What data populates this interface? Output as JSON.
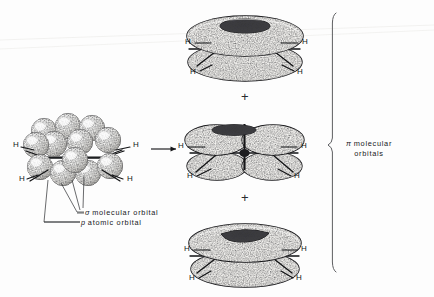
{
  "figure": {
    "background_color": "#fdfdfd",
    "ink_color": "#15161a"
  },
  "atom_label": "H",
  "operators": {
    "arrow": "→",
    "plus": "+"
  },
  "left_structure": {
    "name": "p-orbital-sphere-cluster",
    "sphere_count": 12,
    "hydrogens": [
      {
        "text": "H",
        "x": 13,
        "y": 145
      },
      {
        "text": "H",
        "x": 133,
        "y": 145
      },
      {
        "text": "H",
        "x": 19,
        "y": 177
      },
      {
        "text": "H",
        "x": 128,
        "y": 177
      }
    ],
    "callouts": [
      {
        "symbol": "σ",
        "text": "molecular orbital"
      },
      {
        "symbol": "p",
        "text": "atomic orbital"
      }
    ]
  },
  "right_structures": [
    {
      "name": "pi-orbital-torus-pair-top",
      "lobes": 2,
      "shape": "torus",
      "hydrogens": [
        {
          "text": "H",
          "x": 186,
          "y": 40
        },
        {
          "text": "H",
          "x": 302,
          "y": 40
        },
        {
          "text": "H",
          "x": 191,
          "y": 69
        },
        {
          "text": "H",
          "x": 297,
          "y": 69
        }
      ]
    },
    {
      "name": "pi-orbital-four-lobe-middle",
      "lobes": 4,
      "shape": "clover",
      "hydrogens": [
        {
          "text": "H",
          "x": 178,
          "y": 145
        },
        {
          "text": "H",
          "x": 300,
          "y": 145
        },
        {
          "text": "H",
          "x": 183,
          "y": 173
        },
        {
          "text": "H",
          "x": 295,
          "y": 173
        }
      ]
    },
    {
      "name": "pi-orbital-torus-pair-bottom",
      "lobes": 2,
      "shape": "torus",
      "hydrogens": [
        {
          "text": "H",
          "x": 185,
          "y": 247
        },
        {
          "text": "H",
          "x": 301,
          "y": 247
        },
        {
          "text": "H",
          "x": 190,
          "y": 275
        },
        {
          "text": "H",
          "x": 296,
          "y": 275
        }
      ]
    }
  ],
  "bracket": {
    "name": "pi-molecular-orbitals-bracket",
    "label_symbol": "π",
    "label_line1": "molecular",
    "label_line2": "orbitals"
  }
}
